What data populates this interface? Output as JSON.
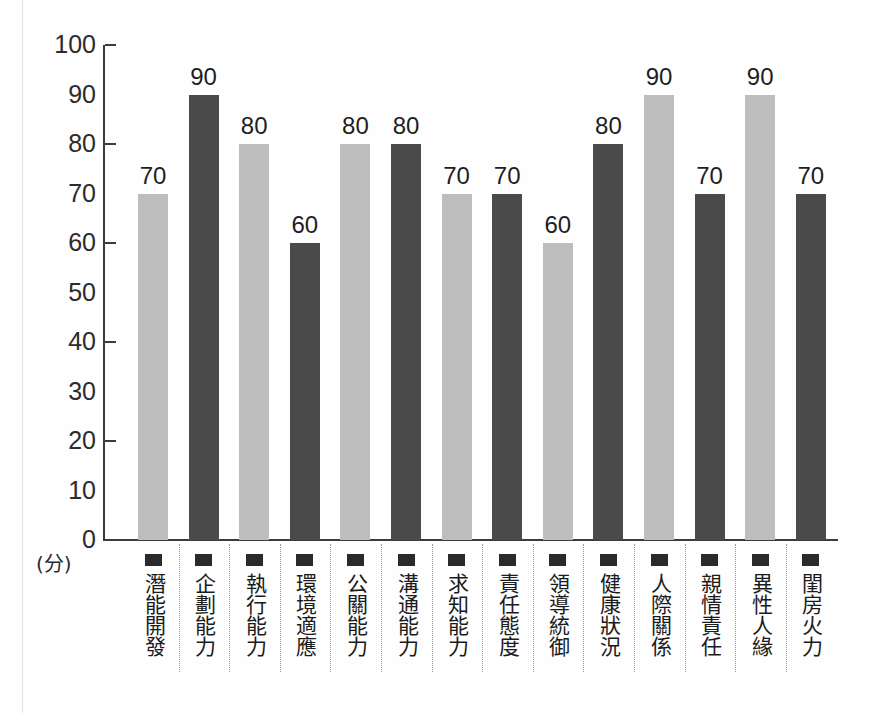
{
  "chart_data": {
    "type": "bar",
    "title": "",
    "subtitle": "",
    "xlabel": "",
    "ylabel": "",
    "yunit": "(分)",
    "ylim": [
      0,
      100
    ],
    "ytick_step": 10,
    "ytick_labels": [
      "100",
      "90",
      "80",
      "70",
      "60",
      "50",
      "40",
      "30",
      "20",
      "10",
      "0"
    ],
    "ytick_values": [
      100,
      90,
      80,
      70,
      60,
      50,
      40,
      30,
      20,
      10,
      0
    ],
    "major_tick_values": [
      100,
      80,
      60,
      40,
      20,
      0
    ],
    "grid": false,
    "legend": "none",
    "categories": [
      "潛能開發",
      "企劃能力",
      "執行能力",
      "環境適應",
      "公關能力",
      "溝通能力",
      "求知能力",
      "責任態度",
      "領導統御",
      "健康狀況",
      "人際關係",
      "親情責任",
      "異性人緣",
      "閨房火力"
    ],
    "values": [
      70,
      90,
      80,
      60,
      80,
      80,
      70,
      70,
      60,
      80,
      90,
      70,
      90,
      70
    ],
    "bar_shades": [
      "light",
      "dark",
      "light",
      "dark",
      "light",
      "dark",
      "light",
      "dark",
      "light",
      "dark",
      "light",
      "dark",
      "light",
      "dark"
    ],
    "colors": {
      "light_bar": "#bdbdbd",
      "dark_bar": "#4a4a4a",
      "axis": "#3c3c3c",
      "text": "#1e1e1e",
      "background": "#fefefe",
      "separator": "#9a9a9a",
      "marker": "#2a2a2a"
    },
    "marker_icon": "filled-square-marker"
  }
}
